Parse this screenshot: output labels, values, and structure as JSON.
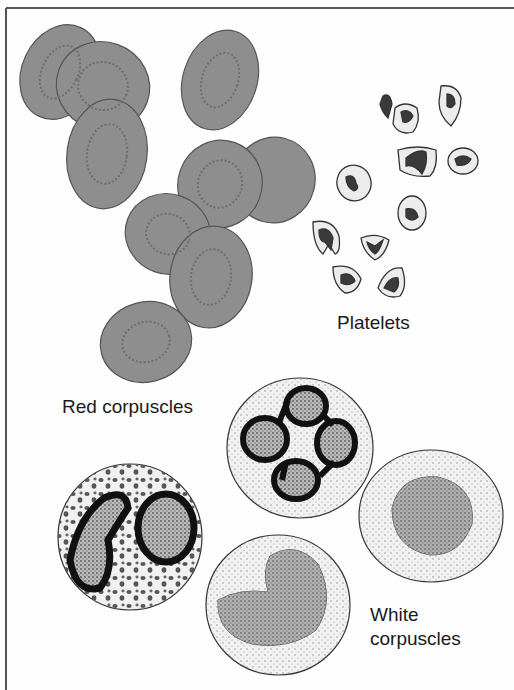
{
  "labels": {
    "red": "Red corpuscles",
    "platelets": "Platelets",
    "white_line1": "White",
    "white_line2": "corpuscles"
  },
  "colors": {
    "background": "#fdfdfd",
    "border": "#555555",
    "red_cell_fill": "#8e8e8e",
    "red_cell_edge": "#555555",
    "platelet_fill": "#ececec",
    "platelet_core": "#3a3a3a",
    "white_cell_fill": "#f1f1f1",
    "nucleus_dark": "#1a1a1a",
    "nucleus_grey": "#8a8a8a"
  }
}
